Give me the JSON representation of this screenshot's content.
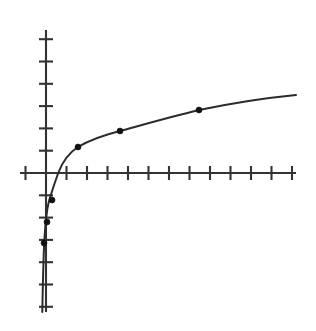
{
  "figure": {
    "background_color": "#ffffff",
    "width": 316,
    "height": 331
  },
  "chart_data": {
    "type": "line",
    "title": "",
    "subtitle": "",
    "xlabel": "",
    "ylabel": "",
    "grid": false,
    "legend": null,
    "legend_position": "none",
    "axis_color": "#333333",
    "curve_color": "#2b2b2b",
    "point_color": "#111111",
    "axes": {
      "origin_px": {
        "x": 46,
        "y": 173
      },
      "x_axis": {
        "start_px": 20,
        "end_px": 296,
        "y_px": 173,
        "tick_spacing_px": 20.5,
        "tick_half_length_px": 7,
        "tick_count_positive": 12,
        "tick_count_negative": 1,
        "tick_labels": []
      },
      "y_axis": {
        "start_px": 30,
        "end_px": 312,
        "x_px": 46,
        "tick_spacing_px": 22.3,
        "tick_half_length_px": 7,
        "tick_count_positive": 6,
        "tick_count_negative": 6,
        "tick_labels": []
      },
      "xlim": [
        -1.27,
        12.2
      ],
      "ylim": [
        -6.3,
        6.4
      ]
    },
    "series": [
      {
        "name": "log-curve",
        "x": [
          0.05,
          0.1,
          0.16,
          0.25,
          0.35,
          0.5,
          0.7,
          0.9,
          1.0,
          1.3,
          1.6,
          2.0,
          2.6,
          3.2,
          4.0,
          5.0,
          6.0,
          7.0,
          8.0,
          9.0,
          10.0,
          11.0,
          12.2
        ],
        "y": [
          -4.32,
          -3.32,
          -2.64,
          -2.0,
          -1.51,
          -1.0,
          -0.51,
          -0.15,
          0.0,
          0.38,
          0.68,
          1.0,
          1.38,
          1.68,
          2.0,
          2.32,
          2.58,
          2.81,
          3.0,
          3.17,
          3.32,
          3.46,
          3.61
        ],
        "formula_hint": "y = log2(x)"
      }
    ],
    "points": [
      {
        "label": "p1",
        "x": 0.25,
        "y": -2.0,
        "px": {
          "x": 44,
          "y": 243
        }
      },
      {
        "label": "p2",
        "x": 0.35,
        "y": -1.51,
        "px": {
          "x": 47,
          "y": 222
        }
      },
      {
        "label": "p3",
        "x": 0.5,
        "y": -1.0,
        "px": {
          "x": 52,
          "y": 200
        }
      },
      {
        "label": "p4",
        "x": 1.6,
        "y": 0.68,
        "px": {
          "x": 78,
          "y": 147
        }
      },
      {
        "label": "p5",
        "x": 3.2,
        "y": 1.68,
        "px": {
          "x": 120,
          "y": 131
        }
      },
      {
        "label": "p6",
        "x": 7.0,
        "y": 2.81,
        "px": {
          "x": 199,
          "y": 110
        }
      }
    ],
    "curve_px_path": "M 42.3,312 C 42.8,286 43.3,262 44.2,243 C 45.2,226 46.4,211 48.8,202 C 51.2,193 54.0,185 58.2,173 C 62.0,163 68.5,153 78.0,147 C 88.0,141 104.0,135 120.0,131 C 142.0,125 170.0,117 199.0,110 C 228.0,104 265.0,98 296.0,95"
  }
}
